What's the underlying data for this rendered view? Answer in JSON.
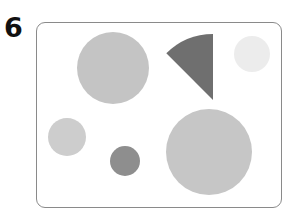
{
  "figure": {
    "label": "6"
  },
  "shapes": [
    {
      "id": "large-circle-top-left",
      "type": "circle",
      "cx": 113,
      "cy": 68,
      "r": 36,
      "color": "#c4c4c4"
    },
    {
      "id": "dark-wedge",
      "type": "sector",
      "apex_x": 213,
      "apex_y": 100,
      "r": 66,
      "color": "#6f6f6f"
    },
    {
      "id": "faint-circle-top-right",
      "type": "circle",
      "cx": 252,
      "cy": 54,
      "r": 18,
      "color": "#ececec"
    },
    {
      "id": "medium-circle-left",
      "type": "circle",
      "cx": 67,
      "cy": 137,
      "r": 19,
      "color": "#cdcdcd"
    },
    {
      "id": "small-dark-circle",
      "type": "circle",
      "cx": 125,
      "cy": 161,
      "r": 15,
      "color": "#8e8e8e"
    },
    {
      "id": "large-circle-bottom-right",
      "type": "circle",
      "cx": 209,
      "cy": 152,
      "r": 43,
      "color": "#c6c6c6"
    }
  ]
}
